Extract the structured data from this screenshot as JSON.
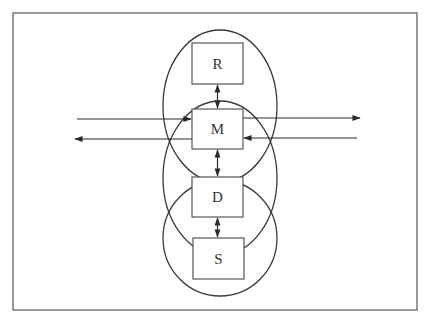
{
  "diagram": {
    "frame": {
      "x": 13,
      "y": 13,
      "w": 404,
      "h": 297
    },
    "stroke_color": "#3a3a3a",
    "ellipses": [
      {
        "name": "upper-circle",
        "cx": 220,
        "cy": 106,
        "rx": 57,
        "ry": 76
      },
      {
        "name": "middle-circle",
        "cx": 220,
        "cy": 178,
        "rx": 57,
        "ry": 77
      },
      {
        "name": "lower-circle",
        "cx": 220,
        "cy": 238,
        "rx": 57,
        "ry": 58
      }
    ],
    "boxes": [
      {
        "id": "R",
        "label": "R",
        "x": 192,
        "y": 43,
        "w": 51,
        "h": 41
      },
      {
        "id": "M",
        "label": "M",
        "x": 192,
        "y": 109,
        "w": 51,
        "h": 40
      },
      {
        "id": "D",
        "label": "D",
        "x": 192,
        "y": 177,
        "w": 51,
        "h": 40
      },
      {
        "id": "S",
        "label": "S",
        "x": 193,
        "y": 238,
        "w": 51,
        "h": 41
      }
    ],
    "connections": [
      {
        "from": "R",
        "to": "M",
        "type": "bidirectional"
      },
      {
        "from": "M",
        "to": "D",
        "type": "bidirectional"
      },
      {
        "from": "D",
        "to": "S",
        "type": "bidirectional"
      }
    ],
    "external_arrows": [
      {
        "name": "input-left-to-M",
        "x1": 77,
        "y1": 119,
        "x2": 191,
        "y2": 119
      },
      {
        "name": "output-M-to-left",
        "x1": 192,
        "y1": 139,
        "x2": 75,
        "y2": 139
      },
      {
        "name": "output-M-to-right",
        "x1": 243,
        "y1": 118,
        "x2": 360,
        "y2": 118
      },
      {
        "name": "input-right-to-M",
        "x1": 357,
        "y1": 138,
        "x2": 244,
        "y2": 138
      }
    ]
  }
}
